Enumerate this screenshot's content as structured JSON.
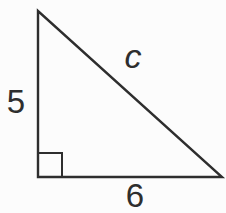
{
  "figure": {
    "type": "right-triangle",
    "ink_color": "#2e2e2e",
    "background_color": "#fcfcfc",
    "sides": {
      "vertical_leg": {
        "label": "5",
        "value": 5
      },
      "horizontal_leg": {
        "label": "6",
        "value": 6
      },
      "hypotenuse": {
        "label": "c"
      }
    },
    "right_angle_marker": "bottom-left"
  }
}
